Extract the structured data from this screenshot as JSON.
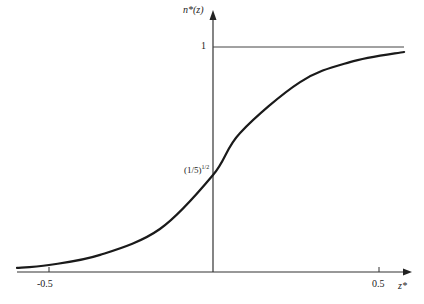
{
  "chart_data": {
    "type": "line",
    "title": "",
    "xlabel": "z*",
    "ylabel": "n*(z)",
    "xlim": [
      -0.6,
      0.6
    ],
    "ylim": [
      0,
      1.05
    ],
    "grid": false,
    "legend": null,
    "x_ticks": [
      "-0.5",
      "0.5"
    ],
    "y_ticks": [
      "1"
    ],
    "annotations": [
      {
        "text": "(1/5)^{1/2}",
        "x": 0,
        "y": 0.447,
        "note": "value of curve at z*=0"
      },
      {
        "text": "1",
        "y": 1,
        "note": "horizontal asymptote line"
      }
    ],
    "series": [
      {
        "name": "n*(z)",
        "x": [
          -0.594,
          -0.497,
          -0.342,
          -0.161,
          0.0,
          0.082,
          0.264,
          0.415,
          0.579
        ],
        "y": [
          0.018,
          0.031,
          0.076,
          0.191,
          0.431,
          0.618,
          0.844,
          0.933,
          0.978
        ]
      }
    ]
  },
  "labels": {
    "y_axis": "n*(z)",
    "x_axis": "z*",
    "tick_neg": "-0.5",
    "tick_pos": "0.5",
    "tick_one": "1",
    "intercept_base": "(1/5)",
    "intercept_exp": "1/2"
  }
}
